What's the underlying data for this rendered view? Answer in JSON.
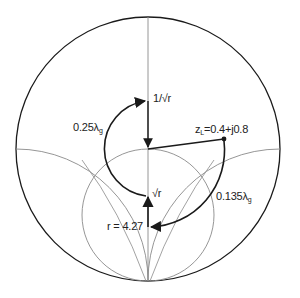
{
  "diagram": {
    "colors": {
      "ink": "#1a1a1a",
      "grid": "#8a8a8a",
      "background": "#ffffff"
    },
    "labels": {
      "inv_sqrt_r": "1/√r",
      "quarter_wave": "0.25λ",
      "quarter_wave_sub": "g",
      "load": "z",
      "load_sub": "L",
      "load_value": "=0.4+j0.8",
      "sqrt_r": "√r",
      "line_length": "0.135λ",
      "line_length_sub": "g",
      "r_value": "r = 4.27"
    },
    "points": {
      "center": [
        148,
        149
      ],
      "load": [
        224,
        139
      ],
      "inv_sqrt_r": [
        148,
        100
      ],
      "sqrt_r": [
        148,
        196
      ],
      "r_max": [
        148,
        227
      ]
    }
  }
}
